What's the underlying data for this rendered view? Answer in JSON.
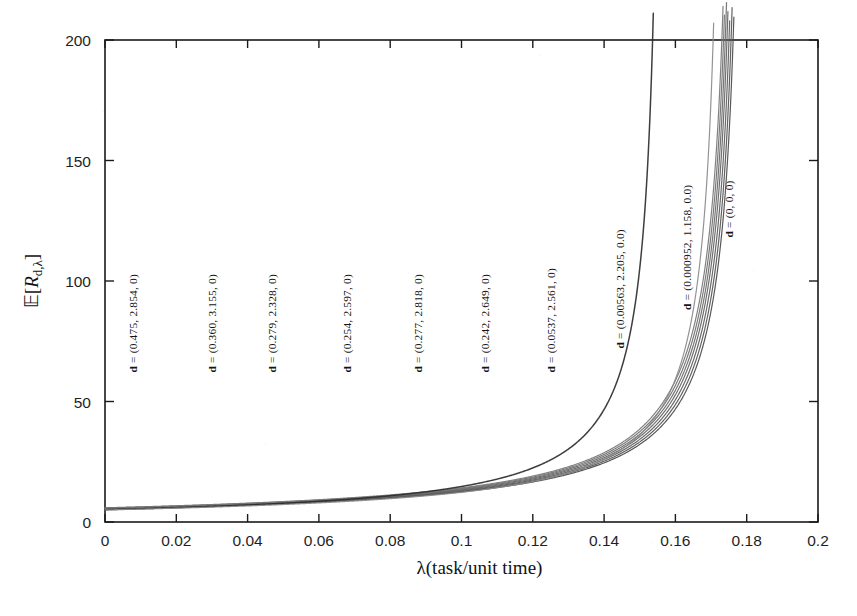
{
  "figure": {
    "background_color": "#ffffff",
    "axis_color": "#1a1a1a"
  },
  "chart_data": {
    "type": "line",
    "title": "",
    "xlabel": "λ(task/unit time)",
    "ylabel": "ᴇ[R_d,λ]",
    "ylabel_parts": {
      "e": "𝔼",
      "bracket_open": "[",
      "r": "R",
      "sub": "d,λ",
      "bracket_close": "]"
    },
    "xlim": [
      0,
      0.2
    ],
    "ylim": [
      0,
      200
    ],
    "xticks": [
      0,
      0.02,
      0.04,
      0.06,
      0.08,
      0.1,
      0.12,
      0.14,
      0.16,
      0.18,
      0.2
    ],
    "xtick_labels": [
      "0",
      "0.02",
      "0.04",
      "0.06",
      "0.08",
      "0.1",
      "0.12",
      "0.14",
      "0.16",
      "0.18",
      "0.2"
    ],
    "yticks": [
      0,
      50,
      100,
      150,
      200
    ],
    "ytick_labels": [
      "0",
      "50",
      "100",
      "150",
      "200"
    ],
    "grid": false,
    "legend": "none",
    "series": [
      {
        "name": "d = (0.475, 2.854, 0)",
        "y0": 5.3,
        "asymptote": 0.1805,
        "color": "#4a4a4a",
        "width": 1.2
      },
      {
        "name": "d = (0.360, 3.155, 0)",
        "y0": 5.4,
        "asymptote": 0.18,
        "color": "#555555",
        "width": 1.2
      },
      {
        "name": "d = (0.279, 2.328, 0)",
        "y0": 5.5,
        "asymptote": 0.1795,
        "color": "#5c5c5c",
        "width": 1.2
      },
      {
        "name": "d = (0.254, 2.597, 0)",
        "y0": 5.6,
        "asymptote": 0.179,
        "color": "#636363",
        "width": 1.2
      },
      {
        "name": "d = (0.277, 2.818, 0)",
        "y0": 5.7,
        "asymptote": 0.1786,
        "color": "#6a6a6a",
        "width": 1.2
      },
      {
        "name": "d = (0.242, 2.649, 0)",
        "y0": 5.8,
        "asymptote": 0.1782,
        "color": "#707070",
        "width": 1.2
      },
      {
        "name": "d = (0.0537, 2.561, 0)",
        "y0": 5.9,
        "asymptote": 0.1778,
        "color": "#777777",
        "width": 1.2
      },
      {
        "name": "d = (0.00563, 2.205, 0.0)",
        "y0": 5.1,
        "asymptote": 0.1572,
        "color": "#2e2e2e",
        "width": 1.5
      },
      {
        "name": "d = (0.000952, 1.158, 0.0)",
        "y0": 5.0,
        "asymptote": 0.1745,
        "color": "#8a8a8a",
        "width": 1.2
      }
    ],
    "annotations": [
      {
        "text": "d = (0.475, 2.854, 0)",
        "x": 0.009,
        "baseline_y": 62,
        "rotation": -90
      },
      {
        "text": "d = (0.360, 3.155, 0)",
        "x": 0.031,
        "baseline_y": 62,
        "rotation": -90
      },
      {
        "text": "d = (0.279, 2.328, 0)",
        "x": 0.048,
        "baseline_y": 62,
        "rotation": -90
      },
      {
        "text": "d = (0.254, 2.597, 0)",
        "x": 0.069,
        "baseline_y": 62,
        "rotation": -90
      },
      {
        "text": "d = (0.277, 2.818, 0)",
        "x": 0.0888,
        "baseline_y": 62,
        "rotation": -90
      },
      {
        "text": "d = (0.242, 2.649, 0)",
        "x": 0.1078,
        "baseline_y": 62,
        "rotation": -90
      },
      {
        "text": "d = (0.0537, 2.561, 0)",
        "x": 0.1262,
        "baseline_y": 62,
        "rotation": -90
      },
      {
        "text": "d = (0.00563, 2.205, 0.0)",
        "x": 0.1455,
        "baseline_y": 72,
        "rotation": -90
      },
      {
        "text": "d = (0.000952, 1.158, 0.0)",
        "x": 0.1645,
        "baseline_y": 88,
        "rotation": -90
      },
      {
        "text": "d = (0, 0, 0)",
        "x": 0.1762,
        "baseline_y": 118,
        "rotation": -90
      }
    ]
  }
}
